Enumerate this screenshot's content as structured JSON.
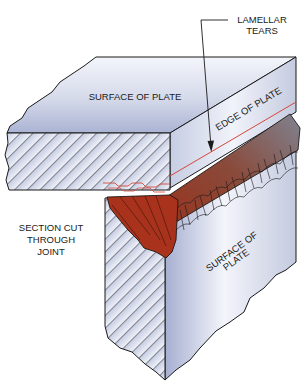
{
  "diagram": {
    "labels": {
      "lamellar_tears_line1": "LAMELLAR",
      "lamellar_tears_line2": "TEARS",
      "surface_of_plate_top": "SURFACE OF PLATE",
      "edge_of_plate": "EDGE OF PLATE",
      "section_line1": "SECTION CUT",
      "section_line2": "THROUGH",
      "section_line3": "JOINT",
      "surface_of_plate_side_line1": "SURFACE OF",
      "surface_of_plate_side_line2": "PLATE"
    },
    "colors": {
      "plate_light": "#eef0f8",
      "plate_mid": "#c9cfe3",
      "plate_dark": "#9aa4c8",
      "weld_red": "#a8321c",
      "weld_gray": "#7d7f8c",
      "tear_line": "#d4483a",
      "outline": "#1a1a1a"
    }
  }
}
